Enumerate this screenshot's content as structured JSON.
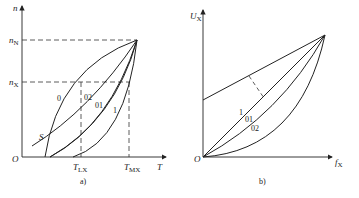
{
  "figure": {
    "panel_a": {
      "caption": "a)",
      "y_axis_label": "n",
      "x_axis_label": "T",
      "origin_label": "O",
      "y_ticks": [
        {
          "main": "n",
          "sub": "N"
        },
        {
          "main": "n",
          "sub": "X"
        }
      ],
      "x_ticks": [
        {
          "main": "T",
          "sub": "LX"
        },
        {
          "main": "T",
          "sub": "MX"
        }
      ],
      "curve_labels": [
        "0",
        "02",
        "01",
        "1"
      ],
      "point_label": "S"
    },
    "panel_b": {
      "caption": "b)",
      "y_axis_label": {
        "main": "U",
        "sub": "X"
      },
      "x_axis_label": {
        "main": "f",
        "sub": "X"
      },
      "origin_label": "O",
      "curve_labels": [
        "1",
        "01",
        "02"
      ]
    },
    "colors": {
      "line": "#222222",
      "background": "#ffffff"
    }
  }
}
